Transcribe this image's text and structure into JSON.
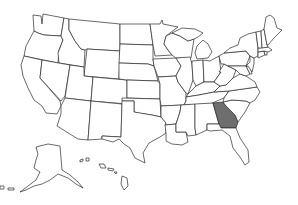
{
  "map": {
    "type": "us-states-outline",
    "highlighted_states": [
      "Georgia"
    ],
    "colors": {
      "background": "#ffffff",
      "state_fill": "#ffffff",
      "highlight_fill": "#6e6e6e",
      "border": "#2a2a2a"
    },
    "states": [
      {
        "id": "WA",
        "name": "Washington",
        "d": "M33,15 L41,16 L42,24 L43,14 L64,18 L61,36 L44,35 L38,33 L34,31 Z",
        "hl": false
      },
      {
        "id": "OR",
        "name": "Oregon",
        "d": "M34,31 L38,33 L44,35 L61,36 L63,40 L59,50 L58,63 L24,56 L26,46 Z",
        "hl": false
      },
      {
        "id": "CA",
        "name": "California",
        "d": "M24,56 L42,60 L40,78 L60,101 L61,106 L57,114 L46,113 L42,106 L34,100 L28,88 L23,76 L21,65 Z",
        "hl": false
      },
      {
        "id": "ID",
        "name": "Idaho",
        "d": "M64,18 L69,19 L69,30 L75,41 L81,49 L85,50 L84,67 L59,63 L58,53 L63,40 L61,36 Z",
        "hl": false
      },
      {
        "id": "NV",
        "name": "Nevada",
        "d": "M42,60 L70,65 L65,96 L61,101 L40,78 Z",
        "hl": false
      },
      {
        "id": "MT",
        "name": "Montana",
        "d": "M69,19 L120,24 L120,51 L87,49 L85,50 L81,49 L75,41 L69,30 Z",
        "hl": false
      },
      {
        "id": "WY",
        "name": "Wyoming",
        "d": "M87,49 L120,51 L119,79 L84,76 Z",
        "hl": false
      },
      {
        "id": "UT",
        "name": "Utah",
        "d": "M70,65 L84,67 L84,76 L93,77 L91,101 L65,98 Z",
        "hl": false
      },
      {
        "id": "AZ",
        "name": "Arizona",
        "d": "M65,98 L91,101 L88,140 L78,139 L57,126 L61,114 L61,106 Z",
        "hl": false
      },
      {
        "id": "CO",
        "name": "Colorado",
        "d": "M93,77 L127,80 L127,104 L91,101 Z",
        "hl": false
      },
      {
        "id": "NM",
        "name": "New Mexico",
        "d": "M91,101 L122,104 L121,137 L102,136 L102,139 L88,140 Z",
        "hl": false
      },
      {
        "id": "ND",
        "name": "North Dakota",
        "d": "M120,24 L150,24 L153,45 L120,44 Z",
        "hl": false
      },
      {
        "id": "SD",
        "name": "South Dakota",
        "d": "M120,44 L153,45 L153,59 L154,66 L148,64 L119,63 Z",
        "hl": false
      },
      {
        "id": "NE",
        "name": "Nebraska",
        "d": "M119,63 L148,64 L154,66 L158,81 L127,80 L119,79 Z",
        "hl": false
      },
      {
        "id": "KS",
        "name": "Kansas",
        "d": "M127,80 L158,81 L160,84 L160,99 L127,98 Z",
        "hl": false
      },
      {
        "id": "OK",
        "name": "Oklahoma",
        "d": "M122,98 L160,99 L161,117 L152,115 L138,113 L134,112 L134,101 L122,101 Z",
        "hl": false
      },
      {
        "id": "TX",
        "name": "Texas",
        "d": "M122,101 L134,101 L134,112 L152,115 L161,117 L166,123 L166,133 L160,137 L149,143 L143,153 L145,163 L135,158 L130,148 L124,144 L119,139 L113,142 L102,139 L102,136 L121,137 Z",
        "hl": false
      },
      {
        "id": "MN",
        "name": "Minnesota",
        "d": "M150,24 L160,24 L162,20 L163,24 L178,27 L166,36 L164,44 L168,50 L172,55 L155,56 L153,45 Z",
        "hl": false
      },
      {
        "id": "IA",
        "name": "Iowa",
        "d": "M153,59 L176,58 L181,66 L176,76 L158,77 L154,66 Z",
        "hl": false
      },
      {
        "id": "MO",
        "name": "Missouri",
        "d": "M158,77 L176,76 L178,82 L186,93 L186,101 L184,105 L161,106 L160,99 L160,84 Z",
        "hl": false
      },
      {
        "id": "AR",
        "name": "Arkansas",
        "d": "M161,106 L181,105 L180,112 L176,124 L165,125 L166,123 L161,117 Z",
        "hl": false
      },
      {
        "id": "LA",
        "name": "Louisiana",
        "d": "M165,125 L176,124 L176,132 L186,132 L188,142 L182,145 L172,144 L166,141 L166,133 Z",
        "hl": false
      },
      {
        "id": "WI",
        "name": "Wisconsin",
        "d": "M166,36 L172,33 L180,36 L188,41 L194,39 L191,58 L176,58 L172,55 L168,50 L164,44 Z",
        "hl": false
      },
      {
        "id": "IL",
        "name": "Illinois",
        "d": "M176,58 L190,57 L192,64 L193,80 L188,94 L186,93 L178,82 L176,76 L181,66 Z",
        "hl": false
      },
      {
        "id": "MI",
        "name": "Michigan",
        "d": "M172,33 L182,28 L195,29 L203,33 L198,37 L194,39 L188,41 L180,36 Z M197,46 L203,40 L208,44 L212,52 L208,58 L197,59 L195,53 Z",
        "hl": false
      },
      {
        "id": "IN",
        "name": "Indiana",
        "d": "M192,61 L203,60 L204,82 L196,86 L193,80 L192,64 Z",
        "hl": false
      },
      {
        "id": "OH",
        "name": "Ohio",
        "d": "M203,60 L210,61 L219,56 L221,72 L214,82 L204,82 Z",
        "hl": false
      },
      {
        "id": "KY",
        "name": "Kentucky",
        "d": "M188,94 L193,89 L196,86 L204,82 L214,82 L220,86 L214,92 L199,95 L186,97 Z",
        "hl": false
      },
      {
        "id": "TN",
        "name": "Tennessee",
        "d": "M186,97 L199,95 L214,92 L229,91 L224,98 L210,104 L184,105 L186,101 Z",
        "hl": false
      },
      {
        "id": "MS",
        "name": "Mississippi",
        "d": "M181,105 L195,104 L195,128 L196,135 L188,136 L186,132 L176,132 L176,124 L180,112 Z",
        "hl": false
      },
      {
        "id": "AL",
        "name": "Alabama",
        "d": "M195,104 L213,103 L219,124 L207,124 L207,130 L196,135 L195,128 Z",
        "hl": false
      },
      {
        "id": "GA",
        "name": "Georgia",
        "d": "M213,103 L223,102 L226,106 L235,115 L238,122 L236,128 L221,128 L219,124 Z",
        "hl": true
      },
      {
        "id": "FL",
        "name": "Florida",
        "d": "M207,124 L219,124 L221,128 L236,128 L240,138 L248,150 L249,162 L245,165 L240,157 L233,148 L230,136 L222,130 L210,131 L207,130 Z",
        "hl": false
      },
      {
        "id": "SC",
        "name": "South Carolina",
        "d": "M223,102 L232,100 L246,101 L250,103 L245,112 L238,122 L235,115 L226,106 Z",
        "hl": false
      },
      {
        "id": "NC",
        "name": "North Carolina",
        "d": "M229,91 L257,87 L260,92 L255,100 L250,103 L246,101 L232,100 L223,102 L224,98 Z",
        "hl": false
      },
      {
        "id": "VA",
        "name": "Virginia",
        "d": "M220,86 L226,85 L233,78 L240,74 L246,76 L255,82 L257,87 L229,91 L214,92 Z",
        "hl": false
      },
      {
        "id": "WV",
        "name": "West Virginia",
        "d": "M219,72 L224,64 L228,66 L236,70 L233,78 L226,85 L220,86 L214,82 L221,72 Z",
        "hl": false
      },
      {
        "id": "PA",
        "name": "Pennsylvania",
        "d": "M219,56 L224,53 L246,51 L250,56 L246,66 L228,66 L224,64 L221,64 Z",
        "hl": false
      },
      {
        "id": "MD",
        "name": "Maryland",
        "d": "M228,66 L246,66 L250,74 L246,76 L240,74 L236,70 Z",
        "hl": false
      },
      {
        "id": "DE",
        "name": "Delaware",
        "d": "M246,66 L250,66 L252,74 L250,74 Z",
        "hl": false
      },
      {
        "id": "NJ",
        "name": "New Jersey",
        "d": "M250,56 L254,58 L254,64 L252,72 L248,66 L246,66 L250,62 Z",
        "hl": false
      },
      {
        "id": "NY",
        "name": "New York",
        "d": "M224,53 L230,48 L238,45 L240,38 L248,34 L256,32 L258,48 L258,56 L254,58 L250,56 L246,51 Z",
        "hl": false
      },
      {
        "id": "CT",
        "name": "Connecticut",
        "d": "M258,52 L264,51 L265,55 L258,58 Z",
        "hl": false
      },
      {
        "id": "RI",
        "name": "Rhode Island",
        "d": "M264,51 L267,51 L267,55 L265,55 Z",
        "hl": false
      },
      {
        "id": "MA",
        "name": "Massachusetts",
        "d": "M258,48 L268,47 L272,50 L268,52 L264,51 L258,52 Z",
        "hl": false
      },
      {
        "id": "VT",
        "name": "Vermont",
        "d": "M256,32 L261,31 L262,48 L258,48 Z",
        "hl": false
      },
      {
        "id": "NH",
        "name": "New Hampshire",
        "d": "M261,31 L264,29 L267,45 L268,47 L262,48 Z",
        "hl": false
      },
      {
        "id": "ME",
        "name": "Maine",
        "d": "M264,29 L266,17 L270,15 L274,18 L277,28 L282,30 L274,38 L268,45 L267,45 Z",
        "hl": false
      },
      {
        "id": "AK",
        "name": "Alaska",
        "d": "M36,147 L48,144 L60,146 L62,170 L70,175 L78,182 L83,188 L76,184 L68,178 L58,174 L50,180 L42,184 L34,186 L26,190 L20,192 L28,186 L36,180 L40,172 L34,168 L36,160 L38,154 Z M0,186 L4,186 L4,189 L0,189 Z M8,188 L14,188 L14,190 L8,190 Z",
        "hl": false
      },
      {
        "id": "HI",
        "name": "Hawaii",
        "d": "M80,160 L83,159 L83,161 L80,162 Z M86,158 L89,158 L89,161 L86,161 Z M99,164 L104,164 L106,168 L101,168 Z M108,168 L114,169 L113,171 L108,170 Z M114,172 L117,172 L116,174 Z M122,176 L127,178 L128,186 L124,190 L121,184 Z",
        "hl": false
      }
    ]
  }
}
